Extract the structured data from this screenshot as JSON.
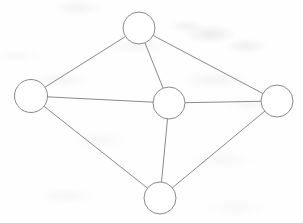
{
  "figure": {
    "kind": "graph-diagram",
    "width": 303,
    "height": 223,
    "background_color": "#fefefe",
    "stroke_color": "#8a8a8e",
    "node_fill_color": "#ffffff",
    "stroke_width": 1,
    "title": "",
    "caption": "",
    "labels_visible": false
  },
  "chart_data": {
    "type": "graph",
    "title": "",
    "xlabel": "",
    "ylabel": "",
    "grid": false,
    "legend": "none",
    "node_count": 5,
    "edge_count": 8,
    "nodes": [
      {
        "id": "top",
        "label": "",
        "cx": 139,
        "cy": 28,
        "r": 16.0,
        "degree": 3
      },
      {
        "id": "left",
        "label": "",
        "cx": 31,
        "cy": 96,
        "r": 16.5,
        "degree": 3
      },
      {
        "id": "center",
        "label": "",
        "cx": 169,
        "cy": 103,
        "r": 16.0,
        "degree": 4
      },
      {
        "id": "right",
        "label": "",
        "cx": 277,
        "cy": 101,
        "r": 16.0,
        "degree": 3
      },
      {
        "id": "bottom",
        "label": "",
        "cx": 160,
        "cy": 198,
        "r": 16.0,
        "degree": 3
      }
    ],
    "edges": [
      {
        "id": "e1",
        "source": "top",
        "target": "left",
        "label": ""
      },
      {
        "id": "e2",
        "source": "top",
        "target": "right",
        "label": ""
      },
      {
        "id": "e3",
        "source": "top",
        "target": "center",
        "label": ""
      },
      {
        "id": "e4",
        "source": "left",
        "target": "center",
        "label": ""
      },
      {
        "id": "e5",
        "source": "left",
        "target": "bottom",
        "label": ""
      },
      {
        "id": "e6",
        "source": "center",
        "target": "right",
        "label": ""
      },
      {
        "id": "e7",
        "source": "center",
        "target": "bottom",
        "label": ""
      },
      {
        "id": "e8",
        "source": "bottom",
        "target": "right",
        "label": ""
      }
    ]
  }
}
